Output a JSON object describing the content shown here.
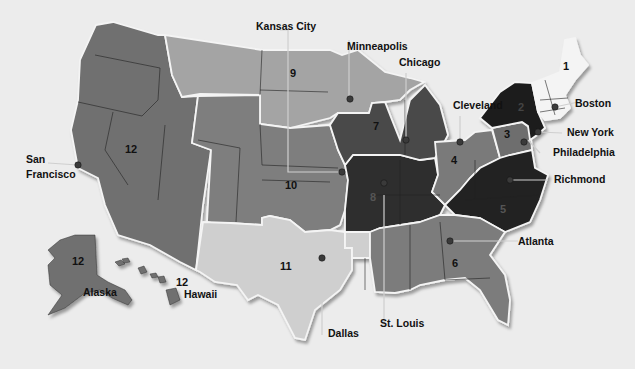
{
  "map": {
    "title": "Federal Reserve Districts",
    "colors": {
      "background": "#ececec",
      "d1": "#f4f4f4",
      "d2": "#1e1e1e",
      "d3": "#6e6e6e",
      "d4": "#7a7a7a",
      "d5": "#232323",
      "d6": "#7c7c7c",
      "d7": "#4a4a4a",
      "d8": "#2e2e2e",
      "d9": "#a4a4a4",
      "d10": "#7e7e7e",
      "d11": "#cfcfcf",
      "d12": "#6f6f6f",
      "leader_line": "#cfcfcf",
      "city_dot": "#3a3a3a"
    },
    "districts": [
      {
        "id": "1",
        "label": "1"
      },
      {
        "id": "2",
        "label": "2"
      },
      {
        "id": "3",
        "label": "3"
      },
      {
        "id": "4",
        "label": "4"
      },
      {
        "id": "5",
        "label": "5"
      },
      {
        "id": "6a",
        "label": "6"
      },
      {
        "id": "6b",
        "label": "6"
      },
      {
        "id": "7",
        "label": "7"
      },
      {
        "id": "8",
        "label": "8"
      },
      {
        "id": "9",
        "label": "9"
      },
      {
        "id": "10",
        "label": "10"
      },
      {
        "id": "11",
        "label": "11"
      },
      {
        "id": "12",
        "label": "12"
      },
      {
        "id": "12-alaska",
        "label": "12"
      },
      {
        "id": "12-hawaii",
        "label": "12"
      }
    ],
    "cities": [
      {
        "name": "Boston"
      },
      {
        "name": "New York"
      },
      {
        "name": "Philadelphia"
      },
      {
        "name": "Cleveland"
      },
      {
        "name": "Richmond"
      },
      {
        "name": "Atlanta"
      },
      {
        "name": "Chicago"
      },
      {
        "name": "St. Louis"
      },
      {
        "name": "Minneapolis"
      },
      {
        "name": "Kansas City"
      },
      {
        "name": "Dallas"
      },
      {
        "name": "San Francisco",
        "line1": "San",
        "line2": "Francisco"
      }
    ],
    "regions": [
      {
        "name": "Alaska"
      },
      {
        "name": "Hawaii"
      }
    ]
  }
}
